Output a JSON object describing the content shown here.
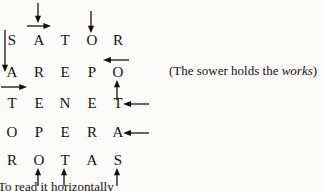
{
  "figure": {
    "kind": "sator-square-diagram",
    "background_color": "#fbfbfa",
    "ink_color": "#15100f",
    "grid": {
      "rows": [
        {
          "id": "row-sator",
          "letters": [
            "S",
            "A",
            "T",
            "O",
            "R"
          ]
        },
        {
          "id": "row-arepo",
          "letters": [
            "A",
            "R",
            "E",
            "P",
            "O"
          ]
        },
        {
          "id": "row-tenet",
          "letters": [
            "T",
            "E",
            "N",
            "E",
            "T"
          ]
        },
        {
          "id": "row-opera",
          "letters": [
            "O",
            "P",
            "E",
            "R",
            "A"
          ]
        },
        {
          "id": "row-rotas",
          "letters": [
            "R",
            "O",
            "T",
            "A",
            "S"
          ]
        }
      ]
    },
    "arrows": [
      {
        "name": "arrow-down-above-col2",
        "direction": "down"
      },
      {
        "name": "arrow-right-above-sator-col2",
        "direction": "right"
      },
      {
        "name": "arrow-down-above-col4",
        "direction": "down"
      },
      {
        "name": "arrow-down-left-of-sator-col1",
        "direction": "down"
      },
      {
        "name": "arrow-left-right-of-arepo-col5",
        "direction": "left"
      },
      {
        "name": "arrow-right-below-arepo-col1",
        "direction": "right"
      },
      {
        "name": "arrow-up-below-arepo-col5",
        "direction": "up"
      },
      {
        "name": "arrow-left-right-of-tenet-col5",
        "direction": "left"
      },
      {
        "name": "arrow-left-right-of-opera-col5",
        "direction": "left"
      },
      {
        "name": "arrow-up-below-rotas-col2",
        "direction": "up"
      },
      {
        "name": "arrow-up-below-rotas-col3",
        "direction": "up"
      },
      {
        "name": "arrow-up-below-rotas-col5",
        "direction": "up"
      }
    ],
    "caption": {
      "open_paren": "(",
      "text_before_italic": "The sower holds the ",
      "italic_word": "works",
      "close_paren": ")"
    },
    "footer": {
      "text": "To read it horizontally"
    }
  }
}
